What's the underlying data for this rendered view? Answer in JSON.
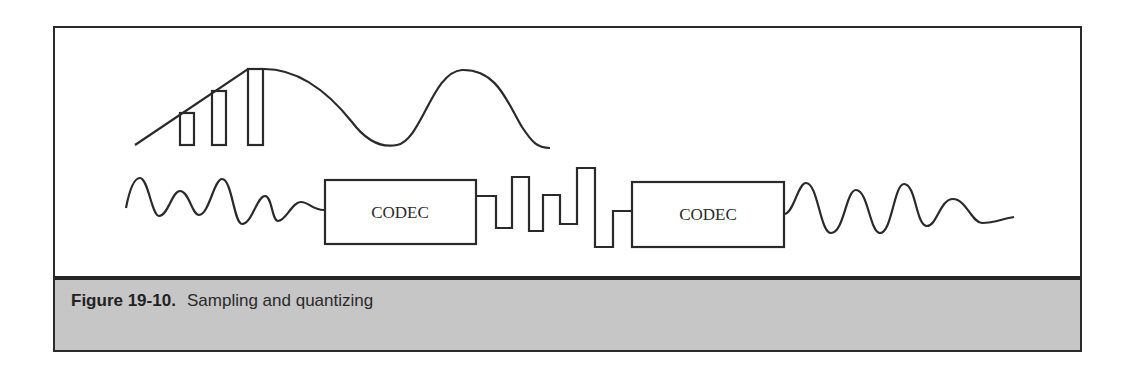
{
  "figure": {
    "label": "Figure 19-10.",
    "caption": "Sampling and quantizing"
  },
  "diagram": {
    "codec_boxes": [
      {
        "label": "CODEC"
      },
      {
        "label": "CODEC"
      }
    ],
    "colors": {
      "stroke": "#2a2a2a",
      "caption_background": "#c6c6c6",
      "separator": "#262626"
    }
  }
}
